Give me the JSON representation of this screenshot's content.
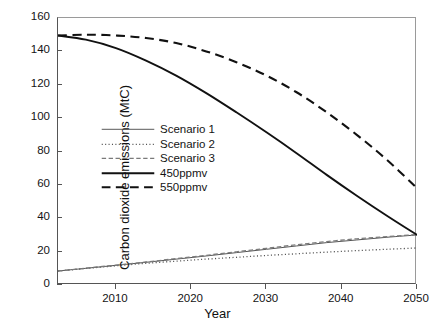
{
  "chart_data": {
    "type": "line",
    "title": "",
    "xlabel": "Year",
    "ylabel": "Carbon dioxide emissions (MtC)",
    "xlim": [
      2002.3,
      2050
    ],
    "ylim": [
      0,
      160
    ],
    "xticks": [
      2010,
      2020,
      2030,
      2040,
      2050
    ],
    "xtick_labels": [
      "2010",
      "2020",
      "2030",
      "2040",
      "2050"
    ],
    "yticks": [
      0,
      20,
      40,
      60,
      80,
      100,
      120,
      140,
      160
    ],
    "ytick_labels": [
      "0",
      "20",
      "40",
      "60",
      "80",
      "100",
      "120",
      "140",
      "160"
    ],
    "grid": false,
    "legend_position": "center-left",
    "series": [
      {
        "name": "Scenario 1",
        "style": "solid-thin",
        "color": "#555555",
        "x": [
          2002.3,
          2006,
          2010,
          2014,
          2018,
          2022,
          2026,
          2030,
          2034,
          2038,
          2042,
          2046,
          2050
        ],
        "values": [
          8.4,
          10.0,
          11.8,
          13.6,
          15.5,
          17.4,
          19.4,
          21.4,
          23.4,
          25.4,
          27.0,
          28.6,
          30.0
        ]
      },
      {
        "name": "Scenario 2",
        "style": "dotted",
        "color": "#555555",
        "x": [
          2002.3,
          2006,
          2010,
          2014,
          2018,
          2022,
          2026,
          2030,
          2034,
          2038,
          2042,
          2046,
          2050
        ],
        "values": [
          8.4,
          9.9,
          11.5,
          13.0,
          14.3,
          15.5,
          16.6,
          17.7,
          18.7,
          19.7,
          20.6,
          21.4,
          22.2
        ]
      },
      {
        "name": "Scenario 3",
        "style": "dashed-thin",
        "color": "#7a7a7a",
        "x": [
          2002.3,
          2006,
          2010,
          2014,
          2018,
          2022,
          2026,
          2030,
          2034,
          2038,
          2042,
          2046,
          2050
        ],
        "values": [
          8.4,
          10.1,
          11.9,
          13.8,
          15.8,
          17.8,
          19.9,
          22.0,
          24.1,
          26.0,
          27.7,
          29.0,
          30.2
        ]
      },
      {
        "name": "450ppmv",
        "style": "solid-thick",
        "color": "#111111",
        "x": [
          2002.3,
          2006,
          2010,
          2014,
          2018,
          2022,
          2026,
          2030,
          2034,
          2038,
          2042,
          2046,
          2050
        ],
        "values": [
          149.5,
          147.0,
          142.0,
          134.5,
          125.5,
          115.0,
          103.5,
          91.5,
          79.0,
          66.0,
          53.5,
          41.5,
          30.0
        ]
      },
      {
        "name": "550ppmv",
        "style": "dashed-thick",
        "color": "#111111",
        "x": [
          2002.3,
          2006,
          2010,
          2014,
          2018,
          2022,
          2026,
          2030,
          2034,
          2038,
          2042,
          2046,
          2050
        ],
        "values": [
          149.5,
          150.0,
          149.5,
          148.0,
          145.0,
          140.0,
          133.5,
          125.5,
          115.5,
          103.5,
          90.0,
          75.0,
          58.0
        ]
      }
    ]
  }
}
